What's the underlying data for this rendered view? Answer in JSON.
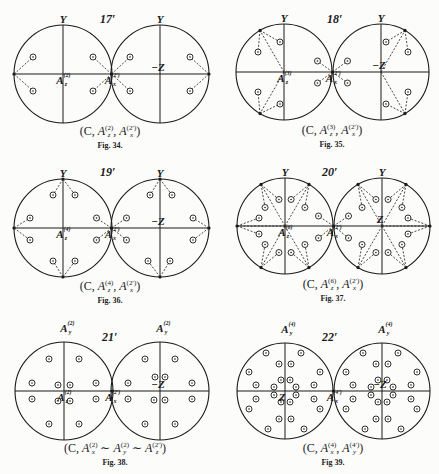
{
  "figures": [
    {
      "id": "fig34",
      "number": "17′",
      "caption": {
        "prefix": "(C, ",
        "parts": [
          {
            "sym": "A",
            "sub": "z",
            "sup": "(2)"
          },
          {
            "sym": "A",
            "sub": "x",
            "sup": "(2′)"
          }
        ],
        "sep": ", ",
        "suffix": ")"
      },
      "caption_text": "(C, A_z^(2), A_x^(2′))",
      "label": "Fig. 34.",
      "box": {
        "x": 0,
        "y": 0
      },
      "left_center": [
        63,
        74
      ],
      "right_center": [
        160,
        74
      ],
      "radius": 49,
      "axis_labels": {
        "left_top": "Y",
        "right_top": "Y",
        "left_center": "A_z^(2)",
        "right_center": "−Z",
        "junction": "A_x^(2′)"
      },
      "points": [
        [
          101,
          57
        ],
        [
          36,
          57
        ],
        [
          101,
          91
        ],
        [
          36,
          91
        ],
        [
          -30,
          57
        ],
        [
          30,
          91
        ],
        [
          -30,
          91
        ],
        [
          30,
          57
        ]
      ]
    },
    {
      "id": "fig35",
      "number": "18′",
      "caption_text": "(C, A_z^(3), A_x^(2′))",
      "caption": {
        "prefix": "(C, ",
        "parts": [
          {
            "sym": "A",
            "sub": "z",
            "sup": "(3)"
          },
          {
            "sym": "A",
            "sub": "x",
            "sup": "(2′)"
          }
        ],
        "sep": ", ",
        "suffix": ")"
      },
      "label": "Fig. 35.",
      "left_center": [
        284,
        72
      ],
      "right_center": [
        381,
        72
      ],
      "radius": 48,
      "axis_labels": {
        "left_top": "Y",
        "right_top": "Y",
        "left_center": "A_z^(3)",
        "right_center": "−Z",
        "junction": "A_x^(2′)"
      }
    },
    {
      "id": "fig36",
      "number": "19′",
      "caption_text": "(C, A_z^(4), A_x^(2′))",
      "caption": {
        "prefix": "(C, ",
        "parts": [
          {
            "sym": "A",
            "sub": "z",
            "sup": "(4)"
          },
          {
            "sym": "A",
            "sub": "x",
            "sup": "(2′)"
          }
        ],
        "sep": ", ",
        "suffix": ")"
      },
      "label": "Fig. 36.",
      "left_center": [
        63,
        228
      ],
      "right_center": [
        160,
        228
      ],
      "radius": 49,
      "axis_labels": {
        "left_top": "Y",
        "right_top": "Y",
        "left_center": "A_z^(4)",
        "right_center": "−Z",
        "junction": "A_x^(2′)"
      }
    },
    {
      "id": "fig37",
      "number": "20′",
      "caption_text": "(C, A_z^(6), A_x^(2′))",
      "caption": {
        "prefix": "(C, ",
        "parts": [
          {
            "sym": "A",
            "sub": "z",
            "sup": "(6)"
          },
          {
            "sym": "A",
            "sub": "x",
            "sup": "(2′)"
          }
        ],
        "sep": ", ",
        "suffix": ")"
      },
      "label": "Fig. 37.",
      "left_center": [
        285,
        226
      ],
      "right_center": [
        382,
        226
      ],
      "radius": 48,
      "axis_labels": {
        "left_top": "Y",
        "right_top": "Y",
        "left_center": "A_z^(6)",
        "right_center": "Z",
        "junction": "A_x^(2′)"
      }
    },
    {
      "id": "fig38",
      "number": "21′",
      "caption_text": "(C, A_x^(2) ∼ A_y^(2) ∼ A_z^(2′))",
      "caption": {
        "prefix": "(C, ",
        "parts": [
          {
            "sym": "A",
            "sub": "x",
            "sup": "(2)"
          },
          {
            "sym": "A",
            "sub": "y",
            "sup": "(2)"
          },
          {
            "sym": "A",
            "sub": "z",
            "sup": "(2′)"
          }
        ],
        "sep": " ∼ ",
        "suffix": ")"
      },
      "label": "Fig. 38.",
      "left_center": [
        64,
        391
      ],
      "right_center": [
        160,
        391
      ],
      "radius": 49,
      "axis_labels": {
        "left_top": "A_y^(2)",
        "right_top": "A_y^(2)",
        "left_center": "A_z^(2)",
        "right_center": "−Z",
        "junction": "A_x^(2′)"
      }
    },
    {
      "id": "fig39",
      "number": "22′",
      "caption_text": "(C, A_x^(4), A_y^(4′))",
      "caption": {
        "prefix": "(C, ",
        "parts": [
          {
            "sym": "A",
            "sub": "x",
            "sup": "(4)"
          },
          {
            "sym": "A",
            "sub": "y",
            "sup": "(4′)"
          }
        ],
        "sep": ", ",
        "suffix": ")"
      },
      "label": "Fig 39.",
      "left_center": [
        285,
        391
      ],
      "right_center": [
        382,
        391
      ],
      "radius": 48,
      "axis_labels": {
        "left_top": "A_y^(4)",
        "right_top": "A_y^(4)",
        "left_center": "Z",
        "right_center": "−Z",
        "junction": "A_x^(4′)"
      }
    }
  ],
  "style": {
    "ink": "#1a1a1a",
    "paper": "#fcfcfa",
    "point_fill": "#fcfcfa"
  }
}
